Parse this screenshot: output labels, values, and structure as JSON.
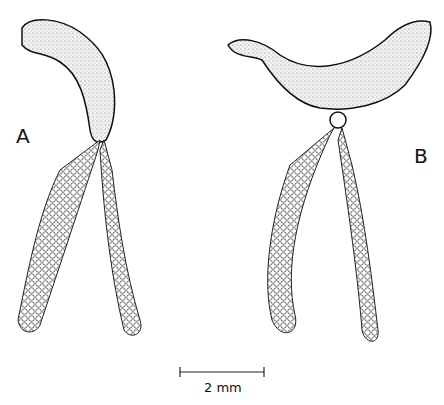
{
  "figure": {
    "labels": {
      "a": "A",
      "b": "B"
    },
    "scale_bar": {
      "label": "2 mm"
    }
  }
}
